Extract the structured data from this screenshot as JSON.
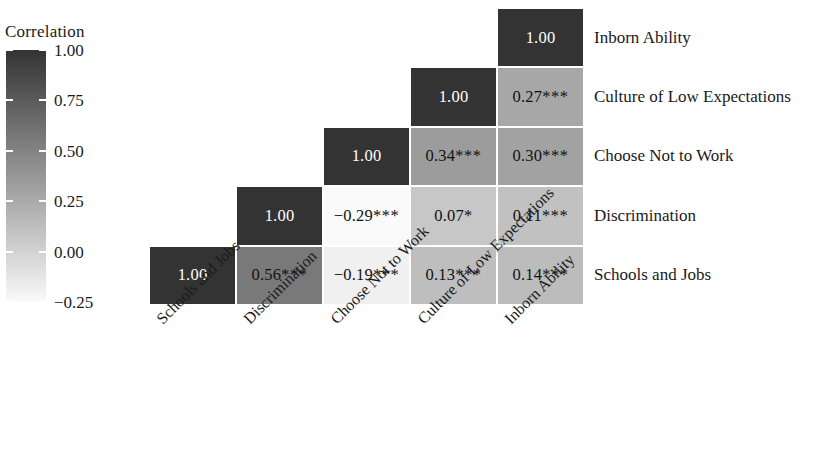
{
  "legend": {
    "title": "Correlation",
    "ticks": [
      "1.00",
      "0.75",
      "0.50",
      "0.25",
      "0.00",
      "-0.25"
    ],
    "scale_min": -0.25,
    "scale_max": 1.0,
    "color_low": "#fafafa",
    "color_high": "#333333"
  },
  "variables": [
    "Schools and Jobs",
    "Discrimination",
    "Choose Not to Work",
    "Culture of Low Expectations",
    "Inborn Ability"
  ],
  "row_labels": [
    "Inborn Ability",
    "Culture of Low Expectations",
    "Choose Not to Work",
    "Discrimination",
    "Schools and Jobs"
  ],
  "col_labels": [
    "Schools and Jobs",
    "Discrimination",
    "Choose Not to Work",
    "Culture of Low Expectations",
    "Inborn Ability"
  ],
  "chart_data": {
    "type": "heatmap",
    "title": "Correlation",
    "xlabel": "",
    "ylabel": "",
    "grid": true,
    "legend_position": "left",
    "colorscale": "grayscale-reversed",
    "zlim": [
      -0.25,
      1.0
    ],
    "x_categories": [
      "Schools and Jobs",
      "Discrimination",
      "Choose Not to Work",
      "Culture of Low Expectations",
      "Inborn Ability"
    ],
    "y_categories": [
      "Schools and Jobs",
      "Discrimination",
      "Choose Not to Work",
      "Culture of Low Expectations",
      "Inborn Ability"
    ],
    "triangle": "upper",
    "cells": [
      {
        "row": 0,
        "col": 0,
        "value": 1.0,
        "label": "1.00",
        "stars": "",
        "text": "1.00"
      },
      {
        "row": 0,
        "col": 1,
        "value": 0.56,
        "label": "0.56",
        "stars": "***",
        "text": "0.56***"
      },
      {
        "row": 0,
        "col": 2,
        "value": -0.19,
        "label": "−0.19",
        "stars": "***",
        "text": "−0.19***"
      },
      {
        "row": 0,
        "col": 3,
        "value": 0.13,
        "label": "0.13",
        "stars": "***",
        "text": "0.13***"
      },
      {
        "row": 0,
        "col": 4,
        "value": 0.14,
        "label": "0.14",
        "stars": "***",
        "text": "0.14***"
      },
      {
        "row": 1,
        "col": 1,
        "value": 1.0,
        "label": "1.00",
        "stars": "",
        "text": "1.00"
      },
      {
        "row": 1,
        "col": 2,
        "value": -0.29,
        "label": "−0.29",
        "stars": "***",
        "text": "−0.29***"
      },
      {
        "row": 1,
        "col": 3,
        "value": 0.07,
        "label": "0.07",
        "stars": "*",
        "text": "0.07*"
      },
      {
        "row": 1,
        "col": 4,
        "value": 0.11,
        "label": "0.11",
        "stars": "***",
        "text": "0.11***"
      },
      {
        "row": 2,
        "col": 2,
        "value": 1.0,
        "label": "1.00",
        "stars": "",
        "text": "1.00"
      },
      {
        "row": 2,
        "col": 3,
        "value": 0.34,
        "label": "0.34",
        "stars": "***",
        "text": "0.34***"
      },
      {
        "row": 2,
        "col": 4,
        "value": 0.3,
        "label": "0.30",
        "stars": "***",
        "text": "0.30***"
      },
      {
        "row": 3,
        "col": 3,
        "value": 1.0,
        "label": "1.00",
        "stars": "",
        "text": "1.00"
      },
      {
        "row": 3,
        "col": 4,
        "value": 0.27,
        "label": "0.27",
        "stars": "***",
        "text": "0.27***"
      },
      {
        "row": 4,
        "col": 4,
        "value": 1.0,
        "label": "1.00",
        "stars": "",
        "text": "1.00"
      }
    ]
  }
}
